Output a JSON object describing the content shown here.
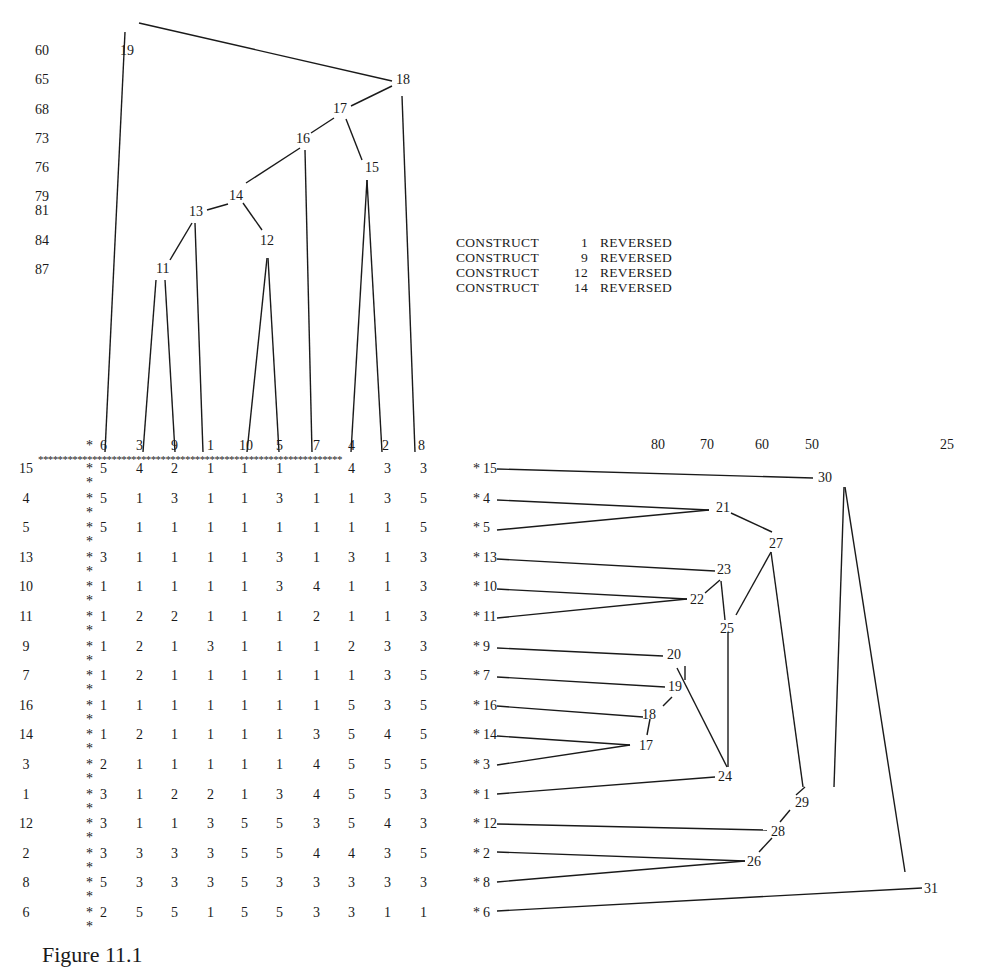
{
  "figure": {
    "caption": "Figure 11.1",
    "notes": [
      {
        "label": "CONSTRUCT",
        "number": "1",
        "status": "REVERSED"
      },
      {
        "label": "CONSTRUCT",
        "number": "9",
        "status": "REVERSED"
      },
      {
        "label": "CONSTRUCT",
        "number": "12",
        "status": "REVERSED"
      },
      {
        "label": "CONSTRUCT",
        "number": "14",
        "status": "REVERSED"
      }
    ]
  },
  "element_tree": {
    "scale_labels": [
      "60",
      "65",
      "68",
      "73",
      "76",
      "79",
      "81",
      "84",
      "87"
    ],
    "leaf_order": [
      "6",
      "3",
      "9",
      "1",
      "10",
      "5",
      "7",
      "4",
      "2",
      "8"
    ],
    "node_labels": [
      "11",
      "12",
      "13",
      "14",
      "15",
      "16",
      "17",
      "18",
      "19"
    ]
  },
  "construct_tree": {
    "scale_labels": [
      "80",
      "70",
      "60",
      "50",
      "25"
    ],
    "leaf_order": [
      "15",
      "4",
      "5",
      "13",
      "10",
      "11",
      "9",
      "7",
      "16",
      "14",
      "3",
      "1",
      "12",
      "2",
      "8",
      "6"
    ],
    "node_labels": [
      "17",
      "18",
      "19",
      "20",
      "21",
      "22",
      "23",
      "24",
      "25",
      "26",
      "27",
      "28",
      "29",
      "30",
      "31"
    ]
  },
  "grid": {
    "column_headers": [
      "6",
      "3",
      "9",
      "1",
      "10",
      "5",
      "7",
      "4",
      "2",
      "8"
    ],
    "rows": [
      {
        "construct": "15",
        "values": [
          "5",
          "4",
          "2",
          "1",
          "1",
          "1",
          "1",
          "4",
          "3",
          "3"
        ]
      },
      {
        "construct": "4",
        "values": [
          "5",
          "1",
          "3",
          "1",
          "1",
          "3",
          "1",
          "1",
          "3",
          "5"
        ]
      },
      {
        "construct": "5",
        "values": [
          "5",
          "1",
          "1",
          "1",
          "1",
          "1",
          "1",
          "1",
          "1",
          "5"
        ]
      },
      {
        "construct": "13",
        "values": [
          "3",
          "1",
          "1",
          "1",
          "1",
          "3",
          "1",
          "3",
          "1",
          "3"
        ]
      },
      {
        "construct": "10",
        "values": [
          "1",
          "1",
          "1",
          "1",
          "1",
          "3",
          "4",
          "1",
          "1",
          "3"
        ]
      },
      {
        "construct": "11",
        "values": [
          "1",
          "2",
          "2",
          "1",
          "1",
          "1",
          "2",
          "1",
          "1",
          "3"
        ]
      },
      {
        "construct": "9",
        "values": [
          "1",
          "2",
          "1",
          "3",
          "1",
          "1",
          "1",
          "2",
          "3",
          "3"
        ]
      },
      {
        "construct": "7",
        "values": [
          "1",
          "2",
          "1",
          "1",
          "1",
          "1",
          "1",
          "1",
          "3",
          "5"
        ]
      },
      {
        "construct": "16",
        "values": [
          "1",
          "1",
          "1",
          "1",
          "1",
          "1",
          "1",
          "5",
          "3",
          "5"
        ]
      },
      {
        "construct": "14",
        "values": [
          "1",
          "2",
          "1",
          "1",
          "1",
          "1",
          "3",
          "5",
          "4",
          "5"
        ]
      },
      {
        "construct": "3",
        "values": [
          "2",
          "1",
          "1",
          "1",
          "1",
          "1",
          "4",
          "5",
          "5",
          "5"
        ]
      },
      {
        "construct": "1",
        "values": [
          "3",
          "1",
          "2",
          "2",
          "1",
          "3",
          "4",
          "5",
          "5",
          "3"
        ]
      },
      {
        "construct": "12",
        "values": [
          "3",
          "1",
          "1",
          "3",
          "5",
          "5",
          "3",
          "5",
          "4",
          "3"
        ]
      },
      {
        "construct": "2",
        "values": [
          "3",
          "3",
          "3",
          "3",
          "5",
          "5",
          "4",
          "4",
          "3",
          "5"
        ]
      },
      {
        "construct": "8",
        "values": [
          "5",
          "3",
          "3",
          "3",
          "5",
          "3",
          "3",
          "3",
          "3",
          "3"
        ]
      },
      {
        "construct": "6",
        "values": [
          "2",
          "5",
          "5",
          "1",
          "5",
          "5",
          "3",
          "3",
          "1",
          "1"
        ]
      }
    ]
  }
}
